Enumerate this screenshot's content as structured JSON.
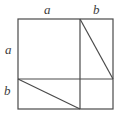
{
  "figure": {
    "background_color": "#ffffff",
    "line_color": "#4a4a4a",
    "label_color": "#3d3d3d",
    "line_width": 1.2,
    "labels": {
      "top_left_segment": "a",
      "top_right_segment": "b",
      "left_upper_segment": "a",
      "left_lower_segment": "b"
    },
    "geometry": {
      "square": {
        "x": 18,
        "y": 19,
        "width": 95,
        "height": 90
      },
      "vertical_divider_x": 80,
      "horizontal_divider_y": 79,
      "upper_diagonal": {
        "x1": 80,
        "y1": 19,
        "x2": 113,
        "y2": 79
      },
      "lower_diagonal": {
        "x1": 18,
        "y1": 79,
        "x2": 80,
        "y2": 109
      }
    }
  }
}
